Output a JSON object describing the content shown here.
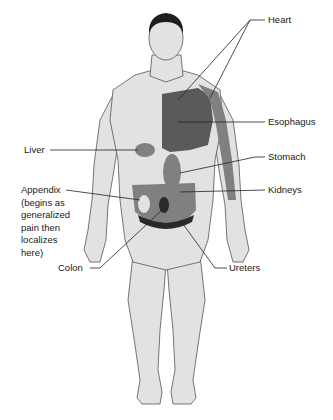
{
  "diagram": {
    "colors": {
      "skin": "#e2e2e2",
      "outline": "#555555",
      "region_medium": "#808080",
      "region_dark": "#5a5a5a",
      "region_darkest": "#2a2a2a",
      "leader_line": "#222222",
      "hair": "#1e1e1e"
    },
    "labels": {
      "heart": "Heart",
      "esophagus": "Esophagus",
      "stomach": "Stomach",
      "kidneys": "Kidneys",
      "ureters": "Ureters",
      "liver": "Liver",
      "appendix": "Appendix\n(begins as\ngeneralized\npain then\nlocalizes\nhere)",
      "colon": "Colon"
    }
  }
}
